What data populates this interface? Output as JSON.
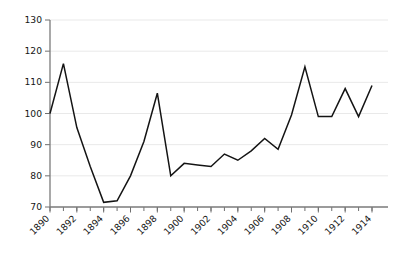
{
  "chart_data": {
    "type": "line",
    "title": "",
    "subtitle": "",
    "xlabel": "",
    "ylabel": "",
    "x": [
      1890,
      1891,
      1892,
      1893,
      1894,
      1895,
      1896,
      1897,
      1898,
      1899,
      1900,
      1901,
      1902,
      1903,
      1904,
      1905,
      1906,
      1907,
      1908,
      1909,
      1910,
      1911,
      1912,
      1913,
      1914
    ],
    "values": [
      100,
      116,
      95.5,
      83,
      71.5,
      72,
      80,
      91,
      106.5,
      80,
      84,
      83.5,
      83,
      87,
      85,
      88,
      92,
      88.5,
      99.5,
      115,
      99,
      99,
      108,
      99,
      109
    ],
    "series": [
      {
        "name": "series-1",
        "color": "#141414",
        "values": [
          100,
          116,
          95.5,
          83,
          71.5,
          72,
          80,
          91,
          106.5,
          80,
          84,
          83.5,
          83,
          87,
          85,
          88,
          92,
          88.5,
          99.5,
          115,
          99,
          99,
          108,
          99,
          109
        ]
      }
    ],
    "xlim": [
      1890,
      1914
    ],
    "ylim": [
      70,
      130
    ],
    "yticks": [
      70,
      80,
      90,
      100,
      110,
      120,
      130
    ],
    "ytick_labels": [
      "70",
      "80",
      "90",
      "100",
      "110",
      "120",
      "130"
    ],
    "xticks": [
      1890,
      1892,
      1894,
      1896,
      1898,
      1900,
      1902,
      1904,
      1906,
      1908,
      1910,
      1912,
      1914
    ],
    "xtick_labels": [
      "1890",
      "1892",
      "1894",
      "1896",
      "1898",
      "1900",
      "1902",
      "1904",
      "1906",
      "1908",
      "1910",
      "1912",
      "1914"
    ],
    "xtick_minor_step": 1,
    "xtick_label_rotation": -45,
    "grid": true,
    "grid_axis": "y",
    "grid_color": "#e9e9e9",
    "legend": false,
    "legend_position": "none",
    "background": "#ffffff",
    "annotations": []
  }
}
